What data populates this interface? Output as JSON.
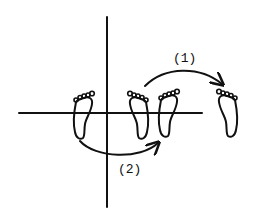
{
  "diagram": {
    "type": "footprint-transformation-diagram",
    "axes": {
      "vertical": {
        "x": 107,
        "y1": 17,
        "y2": 207
      },
      "horizontal": {
        "y": 113,
        "x1": 19,
        "x2": 202
      }
    },
    "footprints": [
      {
        "id": "foot-a",
        "position": "left of vertical axis",
        "toes": "upper-right"
      },
      {
        "id": "foot-b",
        "position": "right of vertical axis",
        "toes": "upper-left"
      },
      {
        "id": "foot-c",
        "position": "right of foot-b",
        "toes": "upper-right"
      },
      {
        "id": "foot-d",
        "position": "far right",
        "toes": "upper-left"
      }
    ],
    "arrows": [
      {
        "id": "arrow-1",
        "label": "(1)",
        "from": "foot-b",
        "to": "foot-d",
        "meaning": "translation"
      },
      {
        "id": "arrow-2",
        "label": "(2)",
        "from": "foot-a",
        "to": "foot-c",
        "meaning": "reflection"
      }
    ]
  },
  "labels": {
    "arrow1": "(1)",
    "arrow2": "(2)"
  },
  "colors": {
    "ink": "#111111",
    "background": "#ffffff"
  }
}
